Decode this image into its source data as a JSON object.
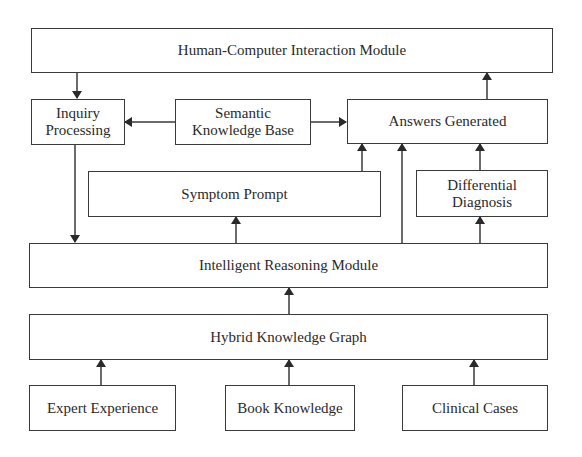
{
  "diagram": {
    "title": "",
    "nodes": {
      "hci": {
        "label": "Human-Computer Interaction Module"
      },
      "inquiry": {
        "label": "Inquiry\nProcessing"
      },
      "semantic": {
        "label": "Semantic\nKnowledge Base"
      },
      "answers": {
        "label": "Answers Generated"
      },
      "symptom": {
        "label": "Symptom Prompt"
      },
      "differential": {
        "label": "Differential\nDiagnosis"
      },
      "reasoning": {
        "label": "Intelligent Reasoning Module"
      },
      "hybrid": {
        "label": "Hybrid Knowledge Graph"
      },
      "expert": {
        "label": "Expert Experience"
      },
      "book": {
        "label": "Book Knowledge"
      },
      "clinical": {
        "label": "Clinical Cases"
      }
    },
    "edges": [
      {
        "from": "hci",
        "to": "inquiry"
      },
      {
        "from": "semantic",
        "to": "inquiry"
      },
      {
        "from": "semantic",
        "to": "answers"
      },
      {
        "from": "answers",
        "to": "hci"
      },
      {
        "from": "inquiry",
        "to": "reasoning"
      },
      {
        "from": "symptom",
        "to": "answers"
      },
      {
        "from": "reasoning",
        "to": "answers"
      },
      {
        "from": "differential",
        "to": "answers"
      },
      {
        "from": "reasoning",
        "to": "symptom"
      },
      {
        "from": "reasoning",
        "to": "differential"
      },
      {
        "from": "hybrid",
        "to": "reasoning"
      },
      {
        "from": "expert",
        "to": "hybrid"
      },
      {
        "from": "book",
        "to": "hybrid"
      },
      {
        "from": "clinical",
        "to": "hybrid"
      }
    ],
    "colors": {
      "stroke": "#3a3a3a",
      "text": "#2a2a2a",
      "background": "#ffffff"
    }
  }
}
